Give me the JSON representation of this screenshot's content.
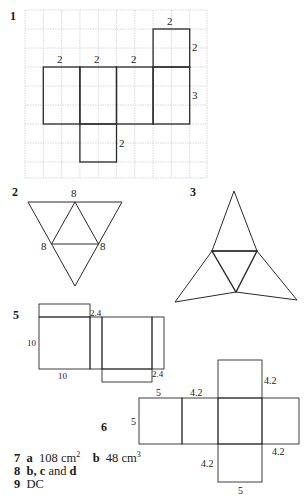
{
  "questions": {
    "q1": {
      "number": "1",
      "labels": [
        "2",
        "2",
        "2",
        "2",
        "2",
        "3",
        "2"
      ]
    },
    "q2": {
      "number": "2",
      "labels": [
        "8",
        "8",
        "8"
      ]
    },
    "q3": {
      "number": "3"
    },
    "q5": {
      "number": "5",
      "labels": {
        "tab": "2.4",
        "side": "10",
        "bottom": "10",
        "strip": "2.4"
      }
    },
    "q6": {
      "number": "6",
      "labels": {
        "top_left": "5",
        "left": "5",
        "top_mid": "4.2",
        "top_tab": "4.2",
        "right": "4.2",
        "bottom_tab_left": "4.2",
        "bottom": "5"
      }
    }
  },
  "answers": {
    "a7": {
      "num": "7",
      "part_a": "a",
      "val_a": "108 cm",
      "sup_a": "2",
      "part_b": "b",
      "val_b": "48 cm",
      "sup_b": "3"
    },
    "a8": {
      "num": "8",
      "text_bold": "b, c",
      "text_mid": " and ",
      "text_end": "d"
    },
    "a9": {
      "num": "9",
      "text": "DC"
    }
  },
  "colors": {
    "grid": "#c8c8c8",
    "line": "#2a2a2a"
  }
}
